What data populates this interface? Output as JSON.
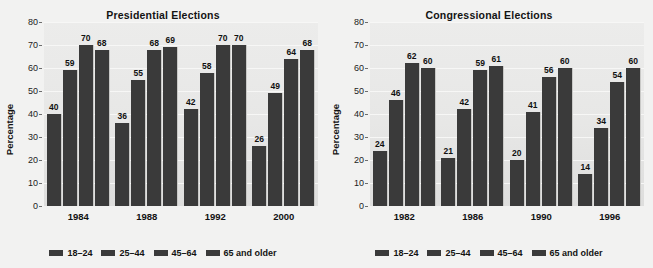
{
  "chart_data": [
    {
      "type": "bar",
      "title": "Presidential Elections",
      "xlabel": "",
      "ylabel": "Percentage",
      "ylim": [
        0,
        80
      ],
      "yticks": [
        80,
        70,
        60,
        50,
        40,
        30,
        20,
        10,
        0
      ],
      "grid": true,
      "legend_position": "bottom",
      "categories": [
        "1984",
        "1988",
        "1992",
        "2000"
      ],
      "series": [
        {
          "name": "18–24",
          "values": [
            40,
            36,
            42,
            26
          ]
        },
        {
          "name": "25–44",
          "values": [
            59,
            55,
            58,
            49
          ]
        },
        {
          "name": "45–64",
          "values": [
            70,
            68,
            70,
            64
          ]
        },
        {
          "name": "65 and older",
          "values": [
            68,
            69,
            70,
            68
          ]
        }
      ]
    },
    {
      "type": "bar",
      "title": "Congressional Elections",
      "xlabel": "",
      "ylabel": "Percentage",
      "ylim": [
        0,
        80
      ],
      "yticks": [
        80,
        70,
        60,
        50,
        40,
        30,
        20,
        10,
        0
      ],
      "grid": true,
      "legend_position": "bottom",
      "categories": [
        "1982",
        "1986",
        "1990",
        "1996"
      ],
      "series": [
        {
          "name": "18–24",
          "values": [
            24,
            21,
            20,
            14
          ]
        },
        {
          "name": "25–44",
          "values": [
            46,
            42,
            41,
            34
          ]
        },
        {
          "name": "45–64",
          "values": [
            62,
            59,
            56,
            54
          ]
        },
        {
          "name": "65 and older",
          "values": [
            60,
            61,
            60,
            60
          ]
        }
      ]
    }
  ],
  "colors": {
    "bar": "#3a3a3a",
    "plot_background": "#e8e8e7",
    "figure_background": "#f2f2f1",
    "text": "#131313",
    "gridline": "#f7f7f6"
  }
}
